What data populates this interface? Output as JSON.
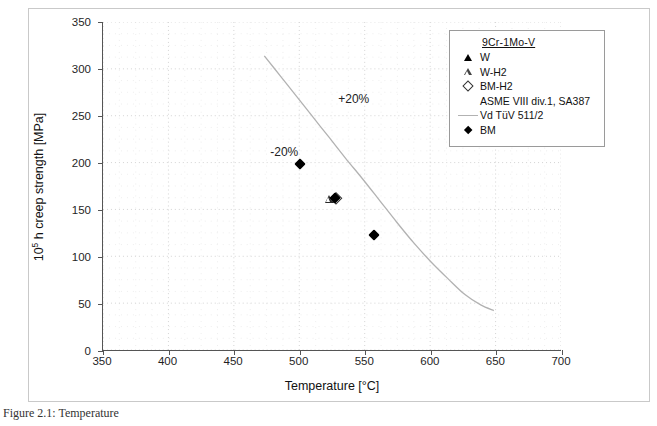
{
  "chart_data": {
    "type": "scatter",
    "title": "",
    "xlabel": "Temperature [°C]",
    "ylabel": "10⁵ h creep strength [MPa]",
    "ylabel_base": "10",
    "ylabel_exp": "5",
    "ylabel_rest": " h creep strength [MPa]",
    "xlim": [
      350,
      700
    ],
    "ylim": [
      0,
      350
    ],
    "xticks": [
      350,
      400,
      450,
      500,
      550,
      600,
      650,
      700
    ],
    "yticks": [
      0,
      50,
      100,
      150,
      200,
      250,
      300,
      350
    ],
    "grid": "dotted-minor-and-major",
    "legend_position": "top-right-inside",
    "annotations": [
      {
        "text": "+20%",
        "x": 542,
        "y": 268
      },
      {
        "text": "-20%",
        "x": 489,
        "y": 212
      }
    ],
    "series": [
      {
        "name": "W",
        "marker": "triangle-filled",
        "points": [
          {
            "x": 526,
            "y": 162
          }
        ]
      },
      {
        "name": "W-H2",
        "marker": "triangle-open",
        "points": [
          {
            "x": 522,
            "y": 162
          }
        ]
      },
      {
        "name": "BM-H2",
        "marker": "diamond-open",
        "points": [
          {
            "x": 528,
            "y": 163
          }
        ]
      },
      {
        "name": "ASME VIII div.1, SA387",
        "marker": "none",
        "points": []
      },
      {
        "name": "Vd TüV 511/2",
        "marker": "line",
        "line_color": "#b2b2b2",
        "curve": [
          {
            "x": 473,
            "y": 314
          },
          {
            "x": 485,
            "y": 293
          },
          {
            "x": 497,
            "y": 272
          },
          {
            "x": 510,
            "y": 249
          },
          {
            "x": 522,
            "y": 228
          },
          {
            "x": 535,
            "y": 205
          },
          {
            "x": 548,
            "y": 183
          },
          {
            "x": 561,
            "y": 160
          },
          {
            "x": 574,
            "y": 137
          },
          {
            "x": 587,
            "y": 115
          },
          {
            "x": 600,
            "y": 95
          },
          {
            "x": 613,
            "y": 77
          },
          {
            "x": 626,
            "y": 60
          },
          {
            "x": 638,
            "y": 49
          },
          {
            "x": 648,
            "y": 43
          }
        ]
      },
      {
        "name": "BM",
        "marker": "diamond-filled",
        "points": [
          {
            "x": 500,
            "y": 199
          },
          {
            "x": 527,
            "y": 163
          },
          {
            "x": 557,
            "y": 123
          }
        ]
      }
    ]
  },
  "legend": {
    "title": "9Cr-1Mo-V",
    "rows": [
      {
        "label": "W",
        "marker": "triangle-filled"
      },
      {
        "label": "W-H2",
        "marker": "triangle-open"
      },
      {
        "label": "BM-H2",
        "marker": "diamond-open"
      },
      {
        "label": "ASME VIII div.1, SA387",
        "marker": "none"
      },
      {
        "label": "Vd TüV 511/2",
        "marker": "line"
      },
      {
        "label": "BM",
        "marker": "diamond-filled"
      }
    ]
  },
  "caption": {
    "text": "Figure 2.1: Temperature"
  },
  "colors": {
    "axis": "#555555",
    "grid": "#d8d8d8",
    "curve": "#b2b2b2",
    "marker": "#000000",
    "frame": "#c9c9c9"
  }
}
